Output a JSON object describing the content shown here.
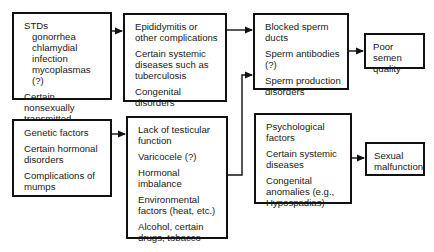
{
  "diagram": {
    "boxes": {
      "stds": {
        "heading": "STDs",
        "sub_items": [
          "gonorrhea",
          "chlamydial infection",
          "mycoplasmas (?)"
        ],
        "items": [
          "Certain nonsexually transmitted organisms"
        ]
      },
      "complications": {
        "items": [
          "Epididymitis or other complications",
          "Certain systemic diseases such as tuberculosis",
          "Congenital disorders"
        ]
      },
      "genetic": {
        "items": [
          "Genetic factors",
          "Certain hormonal disorders",
          "Complications of mumps"
        ]
      },
      "testicular": {
        "items": [
          "Lack of testicular function",
          "Varicocele (?)",
          "Hormonal imbalance",
          "Environmental factors (heat, etc.)",
          "Alcohol, certain drugs, tobacco"
        ]
      },
      "sperm": {
        "items": [
          "Blocked sperm ducts",
          "Sperm antibodies (?)",
          "Sperm production disorders"
        ]
      },
      "poor_semen": {
        "label": "Poor semen quality"
      },
      "psychological": {
        "items": [
          "Psychological factors",
          "Certain systemic diseases",
          "Congenital anomalies (e.g., Hypospadias)"
        ]
      },
      "sexual_malfunction": {
        "label": "Sexual malfunction"
      }
    },
    "edges": [
      {
        "from": "stds",
        "to": "complications"
      },
      {
        "from": "genetic",
        "to": "testicular"
      },
      {
        "from": "complications",
        "to": "sperm"
      },
      {
        "from": "testicular",
        "to": "sperm"
      },
      {
        "from": "sperm",
        "to": "poor_semen"
      },
      {
        "from": "psychological",
        "to": "sexual_malfunction"
      }
    ]
  }
}
